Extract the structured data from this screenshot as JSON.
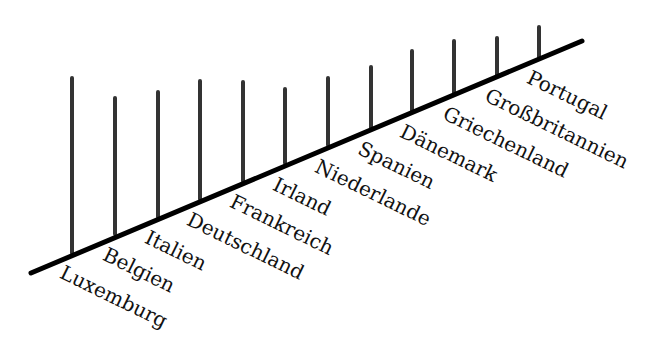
{
  "chart_data": {
    "type": "bar",
    "subtype": "slanted-baseline stick chart",
    "title": "",
    "xlabel": "",
    "ylabel": "",
    "grid": false,
    "legend": null,
    "categories": [
      "Luxemburg",
      "Belgien",
      "Italien",
      "Deutschland",
      "Frankreich",
      "Irland",
      "Niederlande",
      "Spanien",
      "Dänemark",
      "Griechenland",
      "Großbritannien",
      "Portugal"
    ],
    "values": [
      175,
      136,
      125,
      118,
      99,
      74,
      67,
      61,
      60,
      52,
      37,
      30
    ],
    "value_unit": "relative stick height (px, unlabeled)",
    "label_rotation_deg": 26,
    "baseline": {
      "x1": 31,
      "y1": 273,
      "x2": 582,
      "y2": 41
    },
    "sticks": [
      {
        "x": 72,
        "base_y": 253,
        "top_y": 78
      },
      {
        "x": 115,
        "base_y": 234,
        "top_y": 98
      },
      {
        "x": 158,
        "base_y": 217,
        "top_y": 92
      },
      {
        "x": 200,
        "base_y": 199,
        "top_y": 81
      },
      {
        "x": 243,
        "base_y": 181,
        "top_y": 82
      },
      {
        "x": 285,
        "base_y": 163,
        "top_y": 89
      },
      {
        "x": 328,
        "base_y": 145,
        "top_y": 78
      },
      {
        "x": 371,
        "base_y": 128,
        "top_y": 67
      },
      {
        "x": 412,
        "base_y": 111,
        "top_y": 51
      },
      {
        "x": 454,
        "base_y": 93,
        "top_y": 41
      },
      {
        "x": 497,
        "base_y": 75,
        "top_y": 38
      },
      {
        "x": 539,
        "base_y": 57,
        "top_y": 27
      }
    ],
    "label_positions": [
      {
        "x": 66,
        "y": 262
      },
      {
        "x": 109,
        "y": 244
      },
      {
        "x": 151,
        "y": 227
      },
      {
        "x": 193,
        "y": 209
      },
      {
        "x": 236,
        "y": 191
      },
      {
        "x": 279,
        "y": 174
      },
      {
        "x": 321,
        "y": 156
      },
      {
        "x": 364,
        "y": 138
      },
      {
        "x": 406,
        "y": 121
      },
      {
        "x": 449,
        "y": 103
      },
      {
        "x": 491,
        "y": 85
      },
      {
        "x": 533,
        "y": 67
      }
    ]
  },
  "colors": {
    "background": "#ffffff",
    "axis": "#000000",
    "sticks": "#333333",
    "text": "#111111"
  }
}
